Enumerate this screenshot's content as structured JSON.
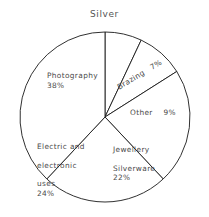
{
  "chart": {
    "title": "Silver"
  },
  "chart_data": {
    "type": "pie",
    "title": "Silver",
    "xlabel": "",
    "ylabel": "",
    "unit": "%",
    "start_angle_deg": 0,
    "direction": "clockwise",
    "legend": "none",
    "grid": false,
    "categories": [
      "Brazing",
      "Other",
      "Jewellery Silverware",
      "Electric and electronic uses",
      "Photography"
    ],
    "values": [
      7,
      9,
      22,
      24,
      38
    ],
    "slices": [
      {
        "name": "brazing",
        "label": "Brazing",
        "label_lines": [
          "Brazing"
        ],
        "value": 7,
        "value_text": "7%",
        "color": "#ffffff",
        "start_deg": 0,
        "end_deg": 25.2
      },
      {
        "name": "other",
        "label": "Other",
        "label_lines": [
          "Other"
        ],
        "value": 9,
        "value_text": "9%",
        "color": "#ffffff",
        "start_deg": 25.2,
        "end_deg": 57.6
      },
      {
        "name": "jewellery-silverware",
        "label": "Jewellery Silverware",
        "label_lines": [
          "Jewellery",
          "Silverware"
        ],
        "value": 22,
        "value_text": "22%",
        "color": "#ffffff",
        "start_deg": 57.6,
        "end_deg": 136.8
      },
      {
        "name": "electric-and-electronic-uses",
        "label": "Electric and electronic uses",
        "label_lines": [
          "Electric and",
          "electronic",
          "uses"
        ],
        "value": 24,
        "value_text": "24%",
        "color": "#ffffff",
        "start_deg": 136.8,
        "end_deg": 223.2
      },
      {
        "name": "photography",
        "label": "Photography",
        "label_lines": [
          "Photography"
        ],
        "value": 38,
        "value_text": "38%",
        "color": "#ffffff",
        "start_deg": 223.2,
        "end_deg": 360
      }
    ],
    "style": {
      "fill": "#ffffff",
      "stroke": "#1a1a1a",
      "background": "#ffffff",
      "text": "#4a4a4a"
    },
    "geometry": {
      "center_x": 105,
      "center_y": 117,
      "radius": 85
    }
  },
  "labels": {
    "photography": {
      "line1": "Photography",
      "pct": "38%"
    },
    "brazing": {
      "line1": "Brazing",
      "pct": "7%"
    },
    "other": {
      "line1": "Other",
      "pct": "9%"
    },
    "jewellery": {
      "line1": "Jewellery",
      "line2": "Silverware",
      "pct": "22%"
    },
    "electric": {
      "line1": "Electric and",
      "line2": "electronic",
      "line3": "uses",
      "pct": "24%"
    }
  }
}
